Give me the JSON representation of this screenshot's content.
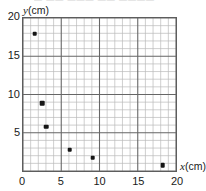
{
  "top_remnant_text": "— —— ——— —— ————",
  "axes": {
    "y_title_var": "y",
    "y_title_unit": "(cm)",
    "x_title_var": "x",
    "x_title_unit": "(cm)"
  },
  "chart_data": {
    "type": "scatter",
    "title": "",
    "xlabel": "x(cm)",
    "ylabel": "y(cm)",
    "xlim": [
      0,
      20
    ],
    "ylim": [
      0,
      20
    ],
    "grid": true,
    "grid_minor_step": 1,
    "grid_major_step": 5,
    "legend": false,
    "xticks": [
      0,
      5,
      10,
      15,
      20
    ],
    "xtick_labels": [
      "0",
      "5",
      "10",
      "15",
      "20"
    ],
    "yticks": [
      5,
      10,
      15,
      20
    ],
    "ytick_labels": [
      "5",
      "10",
      "15",
      "20"
    ],
    "points": [
      {
        "x": 1.5,
        "y": 18
      },
      {
        "x": 2.5,
        "y": 9
      },
      {
        "x": 3,
        "y": 6
      },
      {
        "x": 6,
        "y": 3
      },
      {
        "x": 9,
        "y": 2
      },
      {
        "x": 18,
        "y": 1
      }
    ],
    "marker": "square",
    "marker_color": "#161616"
  }
}
